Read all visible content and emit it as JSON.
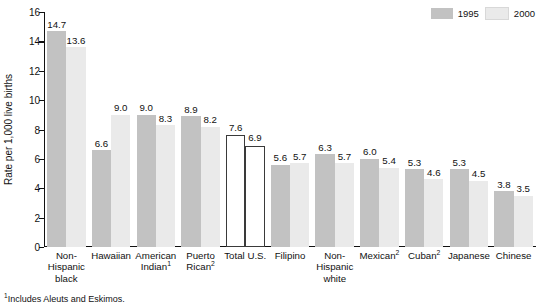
{
  "chart_data": {
    "type": "bar",
    "title": "",
    "xlabel": "",
    "ylabel": "Rate per 1,000 live births",
    "ylim": [
      0,
      16
    ],
    "yticks": [
      0,
      2,
      4,
      6,
      8,
      10,
      12,
      14,
      16
    ],
    "grid": false,
    "legend_position": "top-right",
    "categories": [
      "Non-Hispanic black",
      "Hawaiian",
      "American Indian¹",
      "Puerto Rican²",
      "Total U.S.",
      "Filipino",
      "Non-Hispanic white",
      "Mexican²",
      "Cuban²",
      "Japanese",
      "Chinese"
    ],
    "series": [
      {
        "name": "1995",
        "color": "#c2c2c2",
        "values": [
          14.7,
          6.6,
          9.0,
          8.9,
          7.6,
          5.6,
          6.3,
          6.0,
          5.3,
          5.3,
          3.8
        ]
      },
      {
        "name": "2000",
        "color": "#eaeaea",
        "values": [
          13.6,
          9.0,
          8.3,
          8.2,
          6.9,
          5.7,
          5.7,
          5.4,
          4.6,
          4.5,
          3.5
        ]
      }
    ],
    "annotations": [
      "¹Includes Aleuts and Eskimos."
    ]
  },
  "chart": {
    "y_axis": {
      "label": "Rate per 1,000 live births",
      "ticks": [
        "16",
        "14",
        "12",
        "10",
        "8",
        "6",
        "4",
        "2",
        "0"
      ]
    },
    "legend": [
      {
        "label": "1995",
        "color": "#c2c2c2"
      },
      {
        "label": "2000",
        "color": "#eaeaea"
      }
    ],
    "categories": [
      {
        "lines": [
          "Non-",
          "Hispanic",
          "black"
        ],
        "sup": ""
      },
      {
        "lines": [
          "Hawaiian"
        ],
        "sup": ""
      },
      {
        "lines": [
          "American",
          "Indian"
        ],
        "sup": "1"
      },
      {
        "lines": [
          "Puerto",
          "Rican"
        ],
        "sup": "2"
      },
      {
        "lines": [
          "Total U.S."
        ],
        "sup": ""
      },
      {
        "lines": [
          "Filipino"
        ],
        "sup": ""
      },
      {
        "lines": [
          "Non-",
          "Hispanic",
          "white"
        ],
        "sup": ""
      },
      {
        "lines": [
          "Mexican"
        ],
        "sup": "2"
      },
      {
        "lines": [
          "Cuban"
        ],
        "sup": "2"
      },
      {
        "lines": [
          "Japanese"
        ],
        "sup": ""
      },
      {
        "lines": [
          "Chinese"
        ],
        "sup": ""
      }
    ],
    "bar_labels": {
      "s1995": [
        "14.7",
        "6.6",
        "9.0",
        "8.9",
        "7.6",
        "5.6",
        "6.3",
        "6.0",
        "5.3",
        "5.3",
        "3.8"
      ],
      "s2000": [
        "13.6",
        "9.0",
        "8.3",
        "8.2",
        "6.9",
        "5.7",
        "5.7",
        "5.4",
        "4.6",
        "4.5",
        "3.5"
      ]
    },
    "footnote": "Includes Aleuts and Eskimos.",
    "footnote_marker": "1"
  }
}
